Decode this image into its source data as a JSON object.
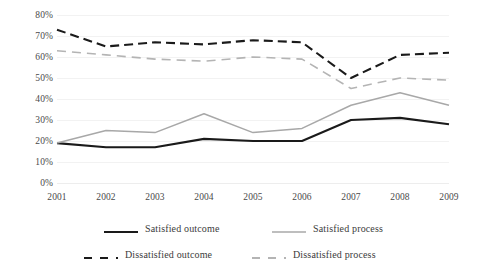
{
  "chart_data": {
    "type": "line",
    "title": "",
    "subtitle": "",
    "xlabel": "",
    "ylabel": "",
    "categories": [
      "2001",
      "2002",
      "2003",
      "2004",
      "2005",
      "2006",
      "2007",
      "2008",
      "2009"
    ],
    "x": [
      2001,
      2002,
      2003,
      2004,
      2005,
      2006,
      2007,
      2008,
      2009
    ],
    "ylim": [
      0,
      80
    ],
    "ytick_labels": [
      "80%",
      "70%",
      "60%",
      "50%",
      "40%",
      "30%",
      "20%",
      "10%",
      "0%"
    ],
    "ytick_values": [
      80,
      70,
      60,
      50,
      40,
      30,
      20,
      10,
      0
    ],
    "grid": true,
    "grid_axis": "y",
    "legend_position": "bottom",
    "legend_columns": 2,
    "value_unit": "%",
    "series": [
      {
        "name": "Satisfied outcome",
        "values": [
          19,
          17,
          17,
          21,
          20,
          20,
          30,
          31,
          28
        ],
        "color": "#1a1a1a",
        "style": "solid",
        "width": 2.1
      },
      {
        "name": "Satisfied process",
        "values": [
          19,
          25,
          24,
          33,
          24,
          26,
          37,
          43,
          37
        ],
        "color": "#a8a8a8",
        "style": "solid",
        "width": 1.5
      },
      {
        "name": "Dissatisfied outcome",
        "values": [
          73,
          65,
          67,
          66,
          68,
          67,
          50,
          61,
          62
        ],
        "color": "#1a1a1a",
        "style": "dashed",
        "width": 2.1,
        "dash": "9,5"
      },
      {
        "name": "Dissatisfied process",
        "values": [
          63,
          61,
          59,
          58,
          60,
          59,
          45,
          50,
          49
        ],
        "color": "#b4b4b4",
        "style": "dashed",
        "width": 1.6,
        "dash": "9,6"
      }
    ]
  },
  "legend": {
    "items": [
      {
        "label": "Satisfied outcome",
        "color": "#1a1a1a",
        "style": "solid"
      },
      {
        "label": "Satisfied process",
        "color": "#a8a8a8",
        "style": "solid"
      },
      {
        "label": "Dissatisfied outcome",
        "color": "#1a1a1a",
        "style": "dashed"
      },
      {
        "label": "Dissatisfied process",
        "color": "#b4b4b4",
        "style": "dashed"
      }
    ]
  },
  "colors": {
    "background": "#ffffff",
    "gridline": "#f2f2f2",
    "text": "#4a4a4a",
    "dark_series": "#1a1a1a",
    "light_series": "#a8a8a8"
  }
}
